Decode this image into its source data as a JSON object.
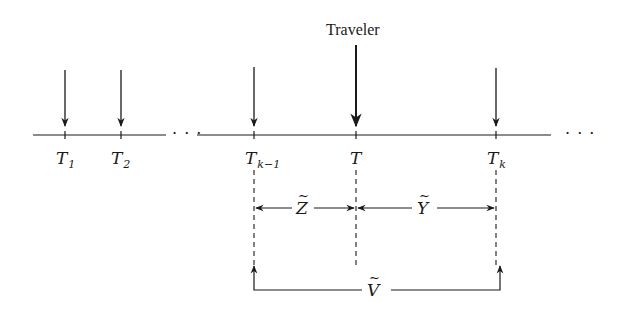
{
  "diagram": {
    "traveler_label": "Traveler",
    "axis_labels": [
      {
        "base": "T",
        "sub": "1"
      },
      {
        "base": "T",
        "sub": "2"
      },
      {
        "base": "T",
        "sub": "k−1"
      },
      {
        "base": "T",
        "sub": ""
      },
      {
        "base": "T",
        "sub": "k"
      }
    ],
    "ellipsis_middle": "· · ·",
    "ellipsis_end": "· · ·",
    "intervals": {
      "z": "Z",
      "y": "Y",
      "v": "V"
    },
    "colors": {
      "ink": "#1a1a1a",
      "background": "#ffffff"
    }
  }
}
